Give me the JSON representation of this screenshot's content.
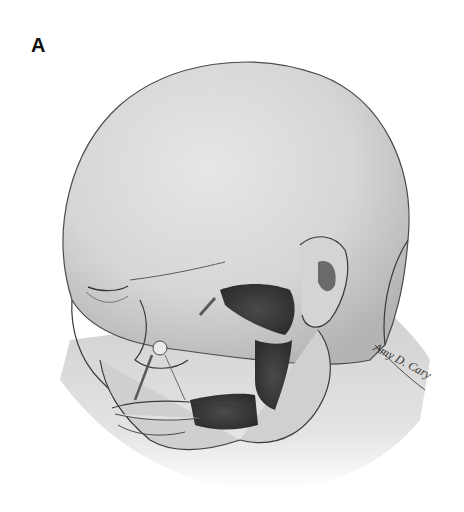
{
  "figure": {
    "panel_label": "A",
    "signature": "Amy D. Cary",
    "colors": {
      "background": "#ffffff",
      "skin": "#d9d9d9",
      "skin_shadow": "#b8b8b8",
      "outline": "#3a3a3a",
      "dark_structure": "#3d3d3d"
    }
  }
}
